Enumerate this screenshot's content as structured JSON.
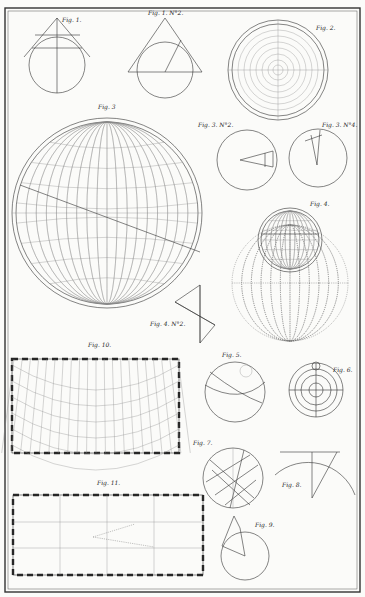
{
  "captions": {
    "fig1": "Fig. 1.",
    "fig1n2": "Fig. 1. N°2.",
    "fig2": "Fig. 2.",
    "fig3": "Fig. 3",
    "fig3n2": "Fig. 3. N°2.",
    "fig3n4": "Fig. 3. N°4.",
    "fig4": "Fig. 4.",
    "fig4n2": "Fig. 4. N°2.",
    "fig5": "Fig. 5.",
    "fig6": "Fig. 6.",
    "fig7": "Fig. 7.",
    "fig8": "Fig. 8.",
    "fig9": "Fig. 9.",
    "fig10": "Fig. 10.",
    "fig11": "Fig. 11."
  },
  "labels": {
    "fig1": [
      "A",
      "F",
      "D",
      "O",
      "B",
      "E",
      "G",
      "C",
      "M"
    ],
    "fig1n2": [
      "A",
      "B",
      "I",
      "K",
      "E",
      "C",
      "F",
      "C",
      "O"
    ],
    "fig2": [
      "B",
      "A",
      "C",
      "D",
      "E"
    ],
    "fig3": [
      "B",
      "F",
      "A",
      "E",
      "C",
      "G",
      "D"
    ],
    "fig3n2": [
      "P",
      "A",
      "B",
      "E",
      "D",
      "C"
    ],
    "fig3n4": [
      "B",
      "G",
      "A",
      "D",
      "P"
    ],
    "fig4": [
      "B",
      "A",
      "C",
      "P",
      "Q",
      "D",
      "K",
      "L",
      "M",
      "N"
    ],
    "fig4n2": [
      "C",
      "A",
      "B",
      "D"
    ],
    "fig5": [
      "R",
      "S",
      "T",
      "H",
      "O",
      "C",
      "Q"
    ],
    "fig6": [
      "A",
      "E",
      "P",
      "T",
      "H",
      "G",
      "C"
    ],
    "fig7": [
      "G",
      "Z",
      "V",
      "R",
      "A",
      "F",
      "V",
      "M",
      "Q",
      "D",
      "L",
      "N",
      "K"
    ],
    "fig8": [
      "H",
      "E",
      "A",
      "C",
      "B"
    ],
    "fig9": [
      "A",
      "B",
      "D",
      "C"
    ],
    "fig10": [
      "A",
      "C",
      "D",
      "H",
      "M",
      "K",
      "L",
      "B"
    ],
    "fig11": [
      "A",
      "G",
      "F",
      "B",
      "K",
      "L",
      "I",
      "E",
      "H",
      "D"
    ]
  }
}
